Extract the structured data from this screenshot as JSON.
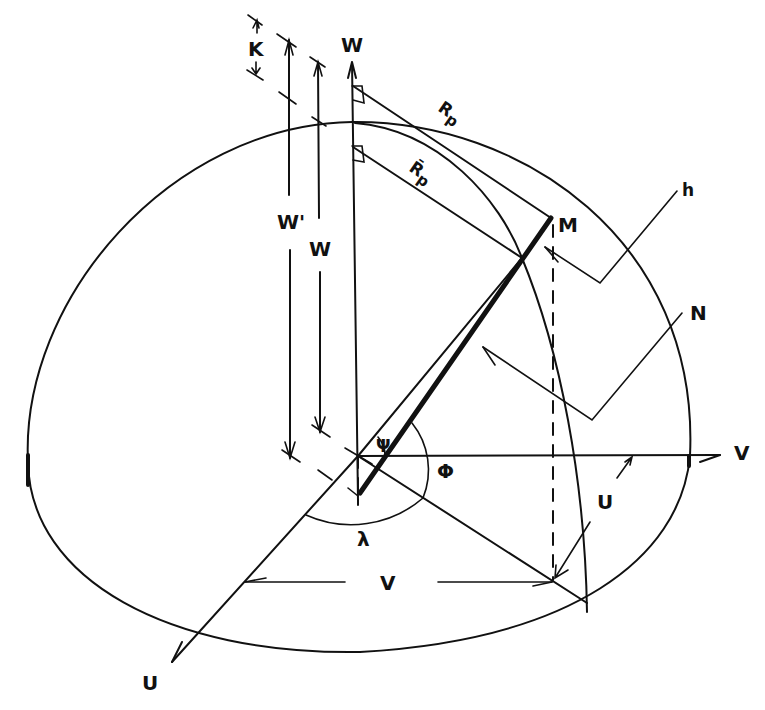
{
  "figure": {
    "type": "ellipsoid geometry diagram",
    "background": "#ffffff",
    "ink_color": "#111111"
  },
  "labels": {
    "w_axis_top": "W",
    "k_dimension": "K",
    "w_prime_dimension": "W'",
    "w_dimension": "W",
    "rp": "R",
    "rp_sub": "p",
    "rp_bar": "R̄",
    "rp_bar_sub": "p",
    "point_m": "M",
    "h_callout": "h",
    "n_callout": "N",
    "psi_angle": "Ψ",
    "phi_angle": "Φ",
    "lambda_angle": "λ",
    "v_axis": "V",
    "u_small": "U",
    "v_dimension": "V",
    "u_axis": "U"
  }
}
